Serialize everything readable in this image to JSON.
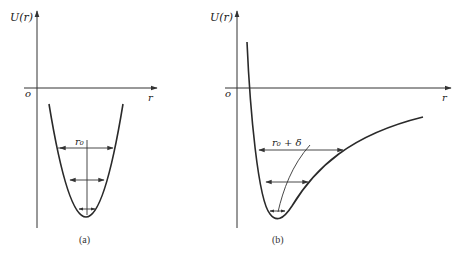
{
  "figure": {
    "panels": [
      {
        "id": "a",
        "caption": "(a)",
        "y_axis_label": "U(r)",
        "x_axis_label": "r",
        "origin_label": "o",
        "curve_type": "symmetric parabola (harmonic potential)",
        "annotation": "r₀",
        "width_arrows": 3,
        "center_line": "vertical straight line at r₀"
      },
      {
        "id": "b",
        "caption": "(b)",
        "y_axis_label": "U(r)",
        "x_axis_label": "r",
        "origin_label": "o",
        "curve_type": "asymmetric anharmonic potential well",
        "annotation": "r₀ + δ",
        "width_arrows": 3,
        "center_line": "curved line through midpoints (shifts right with energy)"
      }
    ]
  }
}
